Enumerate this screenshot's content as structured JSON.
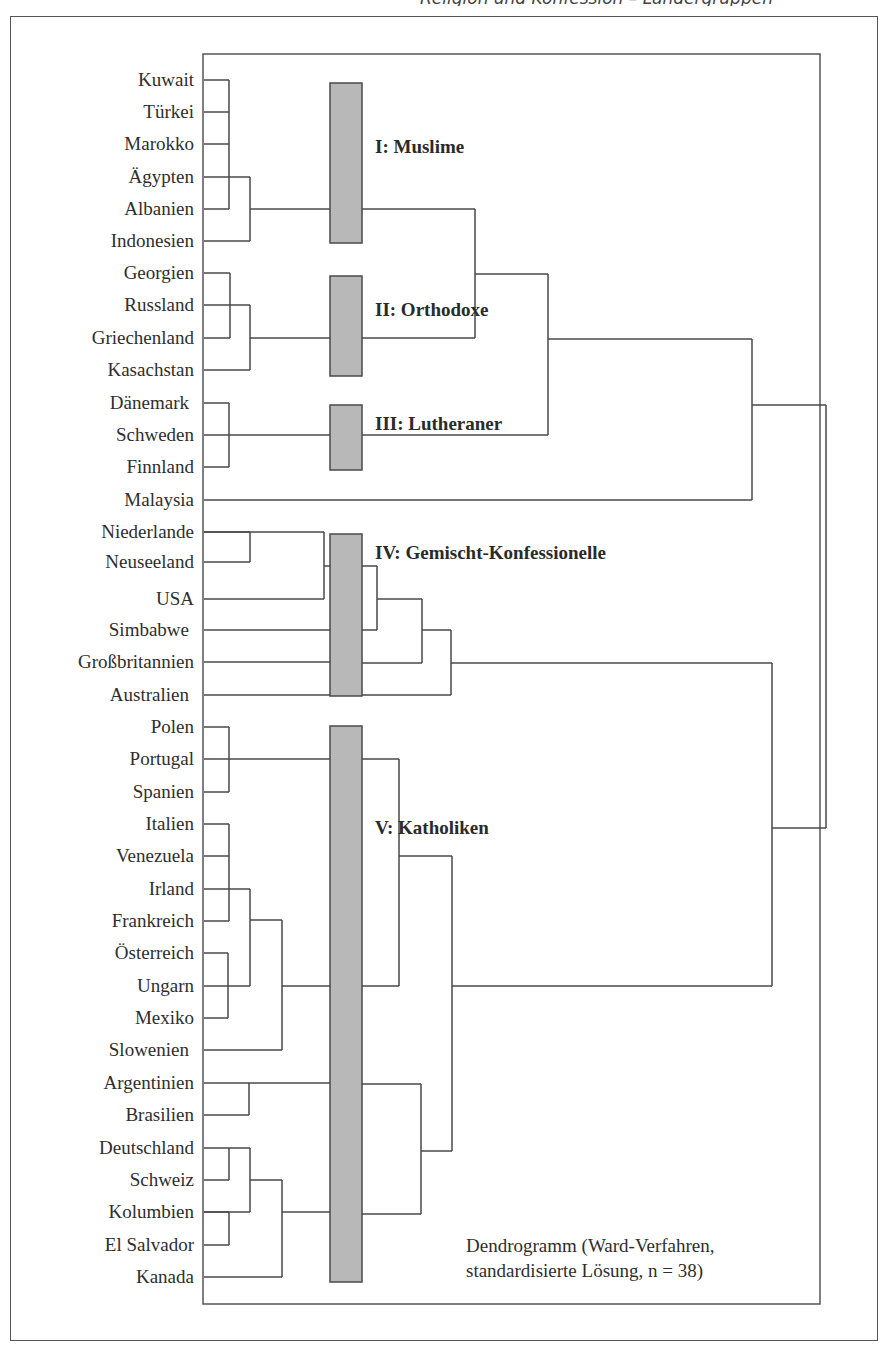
{
  "header": {
    "fragment": "Religion und Konfession – Ländergruppen"
  },
  "countries": [
    "Kuwait",
    "Türkei",
    "Marokko",
    "Ägypten",
    "Albanien",
    "Indonesien",
    "Georgien",
    "Russland",
    "Griechenland",
    "Kasachstan",
    "Dänemark",
    "Schweden",
    "Finnland",
    "Malaysia",
    "Niederlande",
    "Neuseeland",
    "USA",
    "Simbabwe",
    "Großbritannien",
    "Australien",
    "Polen",
    "Portugal",
    "Spanien",
    "Italien",
    "Venezuela",
    "Irland",
    "Frankreich",
    "Österreich",
    "Ungarn",
    "Mexiko",
    "Slowenien",
    "Argentinien",
    "Brasilien",
    "Deutschland",
    "Schweiz",
    "Kolumbien",
    "El Salvador",
    "Kanada"
  ],
  "clusters": [
    {
      "label": "I: Muslime",
      "members": [
        "Kuwait",
        "Türkei",
        "Marokko",
        "Ägypten",
        "Albanien",
        "Indonesien"
      ]
    },
    {
      "label": "II: Orthodoxe",
      "members": [
        "Georgien",
        "Russland",
        "Griechenland",
        "Kasachstan"
      ]
    },
    {
      "label": "III: Lutheraner",
      "members": [
        "Dänemark",
        "Schweden",
        "Finnland"
      ]
    },
    {
      "label": "IV: Gemischt-Konfessionelle",
      "members": [
        "Niederlande",
        "Neuseeland",
        "USA",
        "Simbabwe",
        "Großbritannien",
        "Australien"
      ]
    },
    {
      "label": "V: Katholiken",
      "members": [
        "Polen",
        "Portugal",
        "Spanien",
        "Italien",
        "Venezuela",
        "Irland",
        "Frankreich",
        "Österreich",
        "Ungarn",
        "Mexiko",
        "Slowenien",
        "Argentinien",
        "Brasilien",
        "Deutschland",
        "Schweiz",
        "Kolumbien",
        "El Salvador",
        "Kanada"
      ]
    }
  ],
  "unclustered": [
    "Malaysia"
  ],
  "caption": {
    "line1": "Dendrogramm (Ward-Verfahren,",
    "line2": "standardisierte Lösung, n = 38)"
  },
  "colors": {
    "line": "#4a4a4a",
    "cluster_bar": "#b8b8b8",
    "frame": "#555555"
  }
}
